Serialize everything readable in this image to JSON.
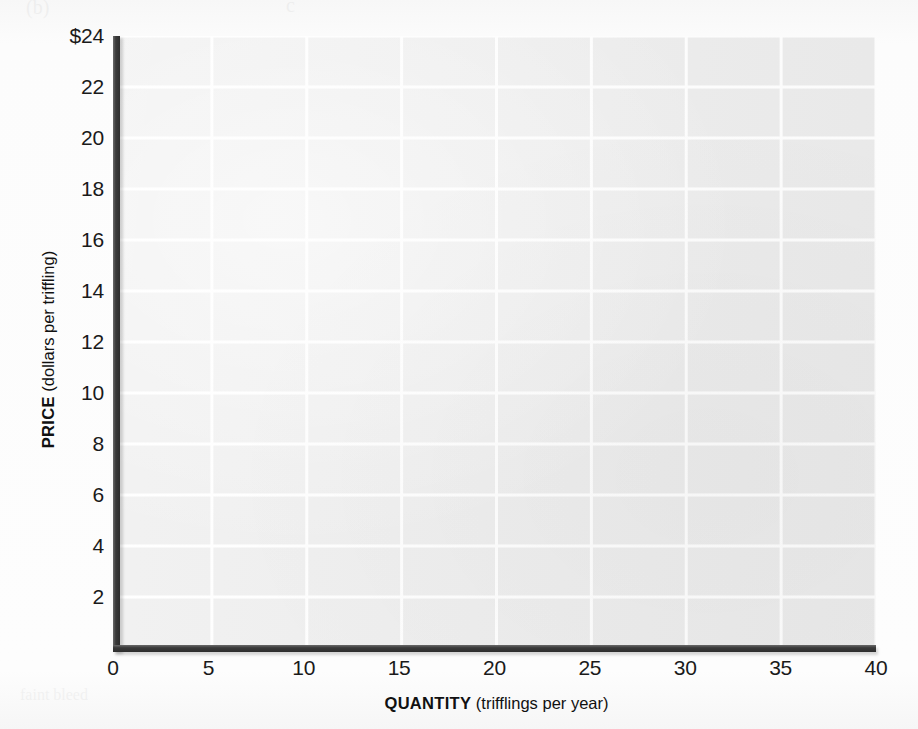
{
  "figure": {
    "kind": "blank-grid-graph",
    "caption_fragment": "(b)"
  },
  "chart_data": {
    "type": "scatter",
    "title": "",
    "subtitle": "",
    "xlabel_bold": "QUANTITY",
    "xlabel_units": "(trifflings per year)",
    "ylabel_bold": "PRICE",
    "ylabel_units": "(dollars per triffling)",
    "x": [],
    "values": [],
    "series": [],
    "annotations": [],
    "legend": [],
    "legend_position": "none",
    "grid": true,
    "grid_color": "#ffffff",
    "plot_background": "#ececec",
    "axis_color": "#333333",
    "xlim": [
      0,
      40
    ],
    "ylim": [
      0,
      24
    ],
    "xtick_step": 5,
    "ytick_step": 2,
    "xticks": [
      "0",
      "5",
      "10",
      "15",
      "20",
      "25",
      "30",
      "35",
      "40"
    ],
    "xtick_values": [
      0,
      5,
      10,
      15,
      20,
      25,
      30,
      35,
      40
    ],
    "yticks": [
      "$24",
      "22",
      "20",
      "18",
      "16",
      "14",
      "12",
      "10",
      "8",
      "6",
      "4",
      "2"
    ],
    "ytick_values": [
      24,
      22,
      20,
      18,
      16,
      14,
      12,
      10,
      8,
      6,
      4,
      2
    ]
  },
  "ghost_text": {
    "top_left": "(b)",
    "top_right": "c",
    "right_mid": "proof page",
    "bottom_left": "faint bleed"
  }
}
